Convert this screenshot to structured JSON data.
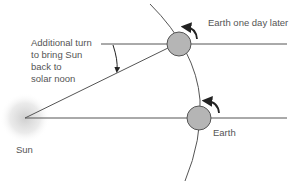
{
  "diagram": {
    "labels": {
      "additional_turn": [
        "Additional turn",
        "to bring Sun",
        "back to",
        "solar noon"
      ],
      "earth_later": "Earth one day later",
      "earth": "Earth",
      "sun": "Sun"
    },
    "colors": {
      "line": "#555555",
      "earth_fill": "#b5b5b5",
      "earth_stroke": "#555555",
      "arrow": "#222222",
      "text": "#555555",
      "sun_glow": "#d0d0d0"
    }
  }
}
